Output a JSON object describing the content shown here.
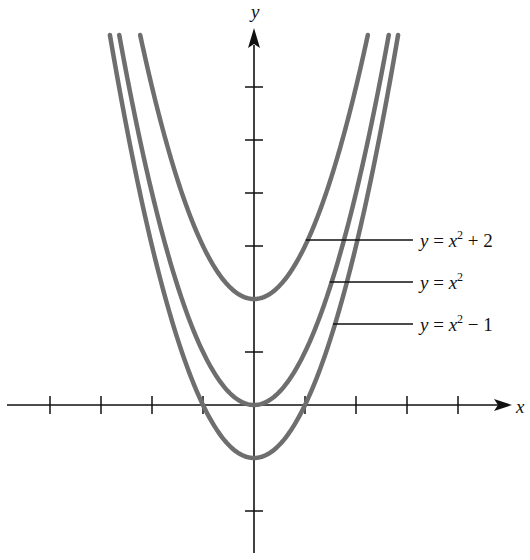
{
  "chart_data": {
    "type": "line",
    "title": "",
    "xlabel": "x",
    "ylabel": "y",
    "xlim": [
      -4.2,
      4.9
    ],
    "ylim": [
      -2.8,
      7.3
    ],
    "x_ticks": [
      -4,
      -3,
      -2,
      -1,
      1,
      2,
      3,
      4
    ],
    "y_ticks": [
      -2,
      -1,
      1,
      2,
      3,
      4,
      5,
      6
    ],
    "tick_labels_shown": false,
    "grid": false,
    "series": [
      {
        "name": "y = x² + 2",
        "formula": "x^2 + 2",
        "shift": 2,
        "label": {
          "pre": "y  =  x",
          "sup": "2",
          "post": " +  2"
        },
        "label_y": 240
      },
      {
        "name": "y = x²",
        "formula": "x^2",
        "shift": 0,
        "label": {
          "pre": "y  =  x",
          "sup": "2",
          "post": ""
        },
        "label_y": 282
      },
      {
        "name": "y = x² − 1",
        "formula": "x^2 - 1",
        "shift": -1,
        "label": {
          "pre": "y  =  x",
          "sup": "2",
          "post": "− 1"
        },
        "label_y": 324
      }
    ],
    "colors": {
      "curve": "#6e6e6e",
      "axis": "#111111"
    }
  },
  "axis_labels": {
    "x": "x",
    "y": "y"
  }
}
